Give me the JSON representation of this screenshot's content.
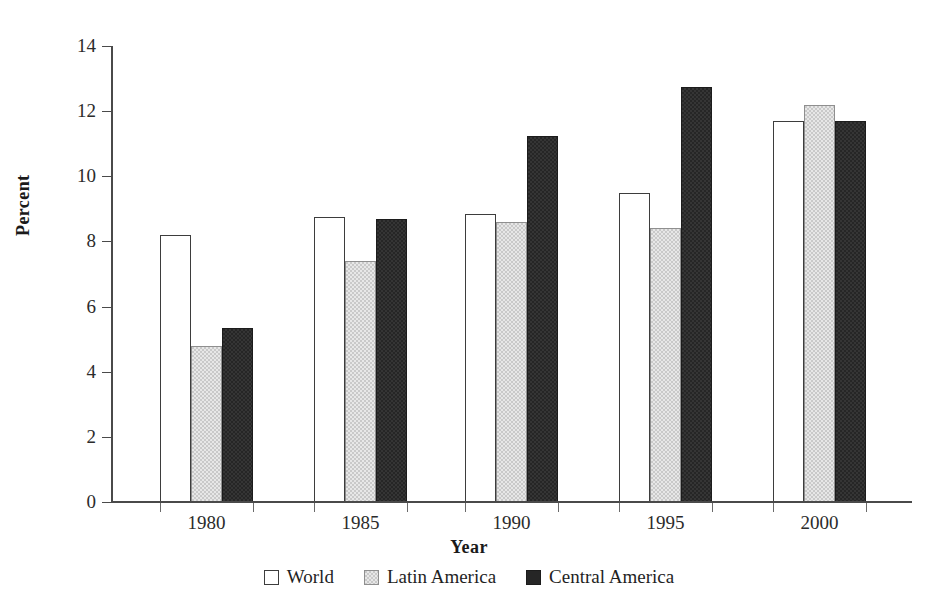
{
  "chart_data": {
    "type": "bar",
    "title": "",
    "subtitle": "",
    "xlabel": "Year",
    "ylabel": "Percent",
    "categories": [
      "1980",
      "1985",
      "1990",
      "1995",
      "2000"
    ],
    "series": [
      {
        "name": "World",
        "values": [
          8.2,
          8.75,
          8.85,
          9.5,
          11.7
        ],
        "color": "#ffffff"
      },
      {
        "name": "Latin America",
        "values": [
          4.8,
          7.4,
          8.6,
          8.4,
          12.2
        ],
        "color": "#c9c9c9"
      },
      {
        "name": "Central America",
        "values": [
          5.35,
          8.7,
          11.25,
          12.75,
          11.7
        ],
        "color": "#262626"
      }
    ],
    "ylim": [
      0,
      14
    ],
    "ytick_values": [
      0,
      2,
      4,
      6,
      8,
      10,
      12,
      14
    ],
    "ytick_labels": [
      "0",
      "2",
      "4",
      "6",
      "8",
      "10",
      "12",
      "14"
    ],
    "ytick_step": 2,
    "grid": false,
    "legend_position": "bottom",
    "legend_entries": [
      "World",
      "Latin America",
      "Central America"
    ],
    "axis_color": "#4a4a4a",
    "text_color": "#1a1a1a",
    "background": "#ffffff"
  }
}
